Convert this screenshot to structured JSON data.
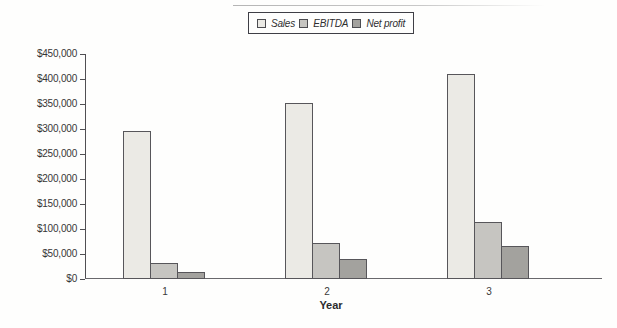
{
  "figure": {
    "background": "#fefefd",
    "artifact_line_color": "#c0c0c0"
  },
  "legend": {
    "border_color": "#3f3f46",
    "position": "top-center"
  },
  "chart_data": {
    "type": "bar",
    "categories": [
      "1",
      "2",
      "3"
    ],
    "series": [
      {
        "name": "Sales",
        "color": "#ebeae5",
        "values": [
          295000,
          352000,
          410000
        ]
      },
      {
        "name": "EBITDA",
        "color": "#c6c5c1",
        "values": [
          32000,
          72000,
          115000
        ]
      },
      {
        "name": "Net profit",
        "color": "#a3a29e",
        "values": [
          13000,
          40000,
          65000
        ]
      }
    ],
    "title": "",
    "xlabel": "Year",
    "ylabel": "",
    "ylim": [
      0,
      450000
    ],
    "ytick_step": 50000,
    "ytick_labels": [
      "$0",
      "$50,000",
      "$100,000",
      "$150,000",
      "$200,000",
      "$250,000",
      "$300,000",
      "$350,000",
      "$400,000",
      "$450,000"
    ],
    "grid": false,
    "legend_position": "top-center",
    "bar_border_color": "#57565a",
    "axis_color": "#504f53",
    "text_color": "#363636"
  }
}
